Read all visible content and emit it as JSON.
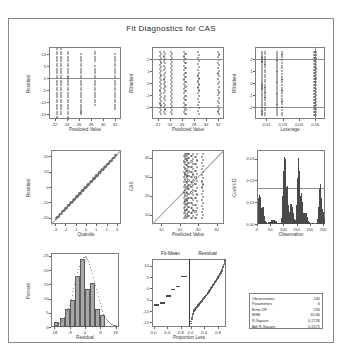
{
  "figure": {
    "title": "Fit Diagnostics for CAS"
  },
  "chart_data": [
    {
      "type": "scatter",
      "name": "residual-vs-predicted",
      "title": "",
      "xlabel": "Predicted Value",
      "ylabel": "Residual",
      "xticks": [
        "22",
        "24",
        "26",
        "28",
        "30",
        "32"
      ],
      "yticks": [
        "10",
        "5",
        "0",
        "-5",
        "-10",
        "-15"
      ],
      "xlim": [
        21,
        33
      ],
      "ylim": [
        -17,
        13
      ],
      "reference_lines": [
        {
          "orientation": "horizontal",
          "y": 0
        }
      ],
      "grid": false,
      "x": [
        22.3,
        22.3,
        22.3,
        22.3,
        22.3,
        22.3,
        22.3,
        22.3,
        22.3,
        22.3,
        22.3,
        22.3,
        22.3,
        22.3,
        22.3,
        22.3,
        22.3,
        22.3,
        22.3,
        22.3,
        22.3,
        22.3,
        22.3,
        22.3,
        22.3,
        22.3,
        22.3,
        22.3,
        22.3,
        22.3,
        23.0,
        23.0,
        23.0,
        23.0,
        23.0,
        23.0,
        23.0,
        23.0,
        23.0,
        23.0,
        23.0,
        23.0,
        23.0,
        23.0,
        23.0,
        23.0,
        23.0,
        23.0,
        23.0,
        23.0,
        23.0,
        23.0,
        23.0,
        23.0,
        23.0,
        23.0,
        23.0,
        23.0,
        24.1,
        24.1,
        24.1,
        24.1,
        24.1,
        24.1,
        24.1,
        24.1,
        24.1,
        24.1,
        24.1,
        24.1,
        24.1,
        24.1,
        24.1,
        24.1,
        24.1,
        24.1,
        24.1,
        24.1,
        24.1,
        24.1,
        24.1,
        24.1,
        24.1,
        24.1,
        24.1,
        24.1,
        24.1,
        24.1,
        24.1,
        24.1,
        26.4,
        26.4,
        26.4,
        26.4,
        26.4,
        26.4,
        26.4,
        26.4,
        26.4,
        26.4,
        26.4,
        26.4,
        26.4,
        26.4,
        26.4,
        26.4,
        26.4,
        26.4,
        26.4,
        26.4,
        26.4,
        26.4,
        26.4,
        26.4,
        26.4,
        26.4,
        26.4,
        26.4,
        28.6,
        28.6,
        28.6,
        28.6,
        28.6,
        28.6,
        28.6,
        28.6,
        28.6,
        28.6,
        28.6,
        28.6,
        28.6,
        28.6,
        28.6,
        28.6,
        28.6,
        28.6,
        28.6,
        28.6,
        28.6,
        28.6,
        32.0,
        32.0,
        32.0,
        32.0,
        32.0,
        32.0,
        32.0,
        32.0,
        32.0,
        32.0,
        32.0,
        32.0,
        32.0,
        32.0,
        32.0,
        32.0,
        32.0,
        32.0,
        32.0,
        32.0,
        32.0,
        32.0,
        32.0,
        32.0
      ],
      "y": [
        12,
        11,
        10,
        9,
        8,
        7,
        6,
        5,
        4,
        3,
        2,
        1,
        0,
        -1,
        -2,
        -3,
        -4,
        -5,
        -6,
        -7,
        -8,
        -9,
        -10,
        -11,
        -12,
        -13,
        -14,
        -15,
        -16,
        -16.5,
        12,
        11,
        10,
        9,
        8,
        7,
        6,
        5,
        4,
        3,
        2,
        1,
        0,
        -1,
        -2,
        -3,
        -4,
        -5,
        -6,
        -7,
        -8,
        -9,
        -10,
        -11,
        -12,
        -13,
        -14,
        -15,
        11,
        10,
        9,
        8,
        7,
        6,
        5,
        4,
        3,
        2,
        1,
        0.5,
        0,
        -0.5,
        -1,
        -2,
        -3,
        -4,
        -5,
        -6,
        -7,
        -8,
        -9,
        -10,
        -11,
        -12,
        -13,
        -14,
        -15,
        -16,
        -16.5,
        -17,
        10,
        9,
        8,
        7,
        6,
        5,
        4,
        3,
        2,
        1,
        0,
        -1,
        -2,
        -3,
        -4,
        -5,
        -6,
        -7,
        -8,
        -9,
        -10,
        -11,
        -12,
        -13,
        -13.5,
        -14,
        -14.5,
        -15,
        11,
        10,
        9,
        8,
        7,
        5,
        4,
        3,
        2,
        1,
        0,
        -1,
        -2,
        -3,
        -4,
        -5,
        -6,
        -7,
        -8,
        -9,
        -10,
        -11,
        10,
        9,
        8,
        7,
        6,
        5,
        4,
        3,
        2,
        1,
        0,
        -1,
        -2,
        -3,
        -4,
        -5,
        -6,
        -7,
        -8,
        -9,
        -10,
        -11,
        -12,
        -13
      ]
    },
    {
      "type": "scatter",
      "name": "rstudent-vs-predicted",
      "xlabel": "Predicted Value",
      "ylabel": "RStudent",
      "xticks": [
        "22",
        "24",
        "26",
        "28",
        "30",
        "32"
      ],
      "yticks": [
        "2",
        "1",
        "0",
        "-1",
        "-2"
      ],
      "xlim": [
        21,
        33
      ],
      "ylim": [
        -3,
        3
      ],
      "reference_lines": [
        {
          "orientation": "horizontal",
          "y": 2
        },
        {
          "orientation": "horizontal",
          "y": -2
        }
      ],
      "grid": false
    },
    {
      "type": "scatter",
      "name": "rstudent-vs-leverage",
      "xlabel": "Leverage",
      "ylabel": "RStudent",
      "xticks": [
        "0.02",
        "0.03",
        "0.04",
        "0.05"
      ],
      "yticks": [
        "2",
        "1",
        "0",
        "-1",
        "-2"
      ],
      "xlim": [
        0.013,
        0.056
      ],
      "ylim": [
        -3,
        3
      ],
      "reference_lines": [
        {
          "orientation": "horizontal",
          "y": 2
        },
        {
          "orientation": "horizontal",
          "y": -2
        },
        {
          "orientation": "vertical",
          "x": 0.05
        }
      ],
      "grid": false
    },
    {
      "type": "scatter",
      "name": "qq-plot",
      "xlabel": "Quantile",
      "ylabel": "Residual",
      "xticks": [
        "-3",
        "-2",
        "-1",
        "0",
        "1",
        "2",
        "3"
      ],
      "yticks": [
        "20",
        "10",
        "0",
        "-10",
        "-20"
      ],
      "xlim": [
        -3.4,
        3.4
      ],
      "ylim": [
        -24,
        24
      ],
      "reference_lines": [
        {
          "orientation": "diagonal"
        }
      ],
      "grid": false
    },
    {
      "type": "scatter",
      "name": "observed-vs-predicted",
      "xlabel": "Predicted Value",
      "ylabel": "CAS",
      "xticks": [
        "10",
        "20",
        "30",
        "40"
      ],
      "yticks": [
        "40",
        "30",
        "20",
        "10"
      ],
      "xlim": [
        5,
        44
      ],
      "ylim": [
        5,
        44
      ],
      "reference_lines": [
        {
          "orientation": "diagonal"
        }
      ],
      "grid": false
    },
    {
      "type": "bar",
      "name": "cooks-d",
      "xlabel": "Observation",
      "ylabel": "Cook's D",
      "xticks": [
        "0",
        "50",
        "100",
        "150",
        "200",
        "250"
      ],
      "yticks": [
        "0.03",
        "0.02",
        "0.01",
        "0.00"
      ],
      "xlim": [
        0,
        258
      ],
      "ylim": [
        0,
        0.034
      ],
      "reference_lines": [
        {
          "orientation": "horizontal",
          "y": 0.0167
        }
      ],
      "grid": false
    },
    {
      "type": "bar",
      "name": "residual-histogram",
      "xlabel": "Residual",
      "ylabel": "Percent",
      "xticks": [
        "-18",
        "-9",
        "0",
        "9",
        "18"
      ],
      "yticks": [
        "25",
        "20",
        "15",
        "10",
        "5",
        "0"
      ],
      "xlim": [
        -20,
        20
      ],
      "ylim": [
        0,
        26
      ],
      "categories": [
        "-16.5",
        "-13.5",
        "-10.5",
        "-7.5",
        "-4.5",
        "-1.5",
        "1.5",
        "4.5",
        "7.5",
        "10.5"
      ],
      "values": [
        1.7,
        3.3,
        6.3,
        9.6,
        18.0,
        23.8,
        13.3,
        15.4,
        6.3,
        4.2
      ],
      "grid": false
    },
    {
      "type": "line",
      "name": "fit-mean-residual",
      "subpanels": [
        "Fit-Mean",
        "Residual"
      ],
      "xlabel": "Proportion Less",
      "ylabel": "",
      "xticks": [
        "0.0",
        "0.4",
        "0.8"
      ],
      "yticks": [
        "10",
        "5",
        "0",
        "-5",
        "-10",
        "-15"
      ],
      "xlim": [
        -0.05,
        1.0
      ],
      "ylim": [
        -17,
        13
      ],
      "grid": false
    }
  ],
  "stats": {
    "rows": [
      {
        "label": "Observations",
        "value": "240"
      },
      {
        "label": "Parameters",
        "value": "6"
      },
      {
        "label": "Error DF",
        "value": "234"
      },
      {
        "label": "MSE",
        "value": "35.66"
      },
      {
        "label": "R-Square",
        "value": "0.2726"
      },
      {
        "label": "Adj R-Square",
        "value": "0.2571"
      }
    ]
  }
}
